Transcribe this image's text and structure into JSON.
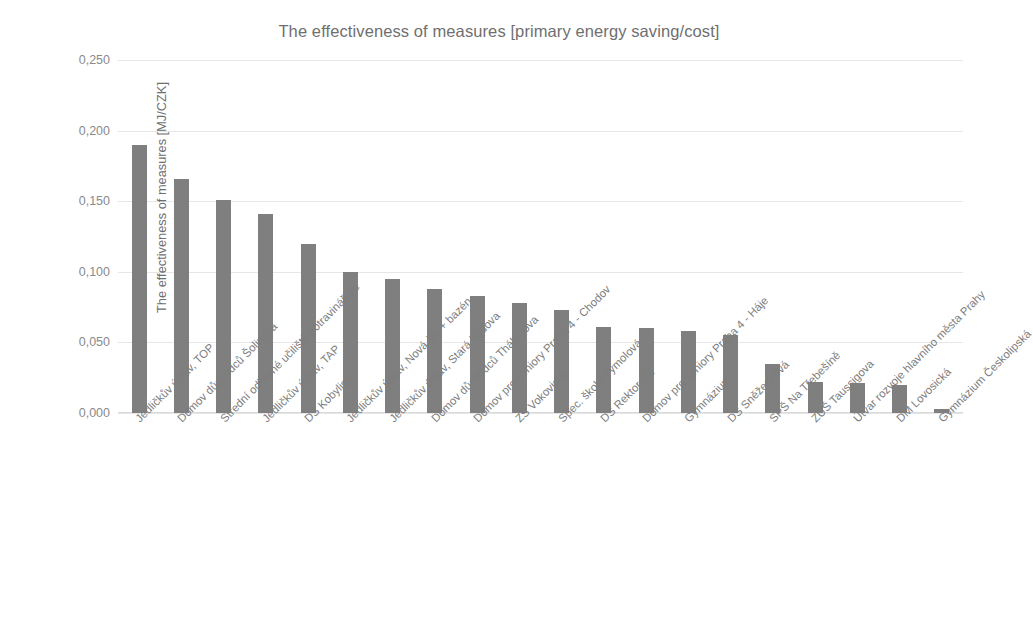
{
  "chart_data": {
    "type": "bar",
    "title": "The effectiveness of measures [primary energy saving/cost]",
    "xlabel": "",
    "ylabel": "The effectiveness of measures [MJ/CZK]",
    "ylim": [
      0.0,
      0.25
    ],
    "ytick_labels": [
      "0,250",
      "0,200",
      "0,150",
      "0,100",
      "0,050",
      "0,000"
    ],
    "ytick_values": [
      0.25,
      0.2,
      0.15,
      0.1,
      0.05,
      0.0
    ],
    "grid": true,
    "legend": "none",
    "bar_color": "#7f7f7f",
    "categories": [
      "Jedličkův ústav, TOP",
      "Domov důchodců Šolinova",
      "Střední odborné učiliště potravinářské",
      "Jedličkův ústav, TAP",
      "DS Kobylisy",
      "Jedličkův ústav, Nová šk. + bazén",
      "Jedličkův ústav, Stará budova",
      "Domov důchodců Thákurova",
      "Domov pro seniory Praha 4 - Chodov",
      "ZŠ Vokovická",
      "Spec. škola Výmolová",
      "DS Rektorská",
      "Domov pro seniory Praha 4 - Háje",
      "Gymnázium",
      "DS Sněženková",
      "SPŠ Na Třebešíně",
      "ZUŠ Taussigova",
      "Útvar rozvoje hlavního města Prahy",
      "DM Lovosická",
      "Gymnázium Českolipská"
    ],
    "values": [
      0.19,
      0.166,
      0.151,
      0.141,
      0.12,
      0.1,
      0.095,
      0.088,
      0.083,
      0.078,
      0.073,
      0.061,
      0.06,
      0.058,
      0.055,
      0.035,
      0.022,
      0.021,
      0.02,
      0.003
    ]
  }
}
